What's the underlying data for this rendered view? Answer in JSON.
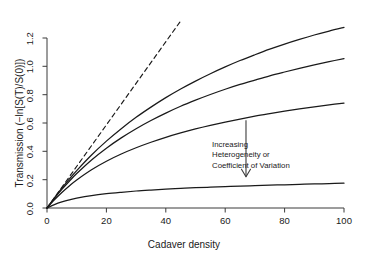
{
  "chart_data": {
    "type": "line",
    "title": "",
    "subtitle": "",
    "xlabel": "Cadaver density",
    "ylabel": "Transmission (−ln[S(T)/S(0)])",
    "xlim": [
      0,
      100
    ],
    "ylim": [
      0.0,
      1.3
    ],
    "xticks": [
      0,
      20,
      40,
      60,
      80,
      100
    ],
    "xtick_labels": [
      "0",
      "20",
      "40",
      "60",
      "80",
      "100"
    ],
    "yticks": [
      0.0,
      0.2,
      0.4,
      0.6,
      0.8,
      1.0,
      1.2
    ],
    "ytick_labels": [
      "0.0",
      "0.2",
      "0.4",
      "0.6",
      "0.8",
      "1.0",
      "1.2"
    ],
    "grid": false,
    "legend": false,
    "legend_position": "none",
    "x": [
      0,
      2.5,
      5,
      7.5,
      10,
      15,
      20,
      25,
      30,
      35,
      40,
      45,
      50,
      55,
      60,
      65,
      70,
      75,
      80,
      85,
      90,
      95,
      100
    ],
    "series": [
      {
        "name": "CV = 0 (homogeneous, mass action)",
        "style": "dashed",
        "color": "#1a1a1a",
        "clipped_at_top": true,
        "x": [
          0,
          45
        ],
        "values": [
          0.0,
          1.32
        ]
      },
      {
        "name": "curve-1-lowest-heterogeneity",
        "style": "solid",
        "color": "#1a1a1a",
        "values": [
          0.0,
          0.072,
          0.14,
          0.204,
          0.264,
          0.374,
          0.472,
          0.56,
          0.64,
          0.712,
          0.779,
          0.84,
          0.896,
          0.948,
          0.996,
          1.041,
          1.082,
          1.121,
          1.157,
          1.19,
          1.221,
          1.249,
          1.275
        ]
      },
      {
        "name": "curve-2",
        "style": "solid",
        "color": "#1a1a1a",
        "values": [
          0.0,
          0.068,
          0.131,
          0.189,
          0.243,
          0.339,
          0.422,
          0.495,
          0.56,
          0.618,
          0.67,
          0.718,
          0.761,
          0.801,
          0.838,
          0.872,
          0.903,
          0.933,
          0.96,
          0.986,
          1.01,
          1.033,
          1.055
        ]
      },
      {
        "name": "curve-3",
        "style": "solid",
        "color": "#1a1a1a",
        "values": [
          0.0,
          0.058,
          0.11,
          0.156,
          0.198,
          0.27,
          0.33,
          0.381,
          0.425,
          0.464,
          0.499,
          0.53,
          0.558,
          0.583,
          0.606,
          0.628,
          0.648,
          0.666,
          0.683,
          0.699,
          0.714,
          0.728,
          0.741
        ]
      },
      {
        "name": "curve-4-highest-heterogeneity",
        "style": "solid",
        "color": "#1a1a1a",
        "values": [
          0.0,
          0.024,
          0.043,
          0.058,
          0.07,
          0.088,
          0.101,
          0.111,
          0.12,
          0.127,
          0.133,
          0.138,
          0.143,
          0.147,
          0.151,
          0.155,
          0.158,
          0.161,
          0.164,
          0.167,
          0.17,
          0.172,
          0.175
        ]
      }
    ],
    "annotations": [
      {
        "name": "heterogeneity-arrow-note",
        "lines": [
          "Increasing",
          "Heterogeneity or",
          "Coefficient of Variation"
        ],
        "arrow": {
          "x": 67,
          "y_start": 0.62,
          "y_end": 0.22,
          "direction": "down"
        }
      }
    ]
  },
  "axis": {
    "x_title": "Cadaver density",
    "y_title": "Transmission (−ln[S(T)/S(0)])",
    "x_tick_labels": [
      "0",
      "20",
      "40",
      "60",
      "80",
      "100"
    ],
    "y_tick_labels": [
      "0.0",
      "0.2",
      "0.4",
      "0.6",
      "0.8",
      "1.0",
      "1.2"
    ]
  },
  "annotation": {
    "line1": "Increasing",
    "line2": "Heterogeneity or",
    "line3": "Coefficient of Variation"
  },
  "colors": {
    "ink": "#1a1a1a",
    "axis": "#3b3b3b",
    "background": "#ffffff"
  }
}
